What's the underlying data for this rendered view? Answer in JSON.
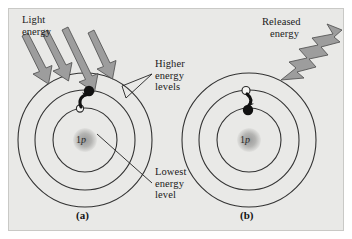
{
  "figure": {
    "type": "science-diagram",
    "background_color": "#e9e9e7",
    "ink_color": "#1a1a1a",
    "accent_gray": "#8d8d8d"
  },
  "panels": [
    {
      "id": "a",
      "caption": "(a)",
      "nucleus_label_number": "1",
      "nucleus_label_symbol": "p",
      "shells": 3,
      "electron_initial_state": "hollow-on-inner-shell",
      "electron_final_state": "filled-on-middle-shell",
      "transition_direction": "up",
      "energy_arrows": {
        "count": 4,
        "name": "light-energy-arrows",
        "direction": "down-right",
        "color": "#8d8d8d"
      }
    },
    {
      "id": "b",
      "caption": "(b)",
      "nucleus_label_number": "1",
      "nucleus_label_symbol": "p",
      "shells": 3,
      "electron_initial_state": "hollow-on-middle-shell",
      "electron_final_state": "filled-on-inner-shell",
      "transition_direction": "down",
      "energy_arrows": {
        "count": 1,
        "name": "released-energy-zigzag",
        "direction": "up-right",
        "color": "#8d8d8d"
      }
    }
  ],
  "labels": {
    "light_energy_line1": "Light",
    "light_energy_line2": "energy",
    "higher_levels_line1": "Higher",
    "higher_levels_line2": "energy",
    "higher_levels_line3": "levels",
    "lowest_level_line1": "Lowest",
    "lowest_level_line2": "energy",
    "lowest_level_line3": "level",
    "released_energy_line1": "Released",
    "released_energy_line2": "energy"
  }
}
